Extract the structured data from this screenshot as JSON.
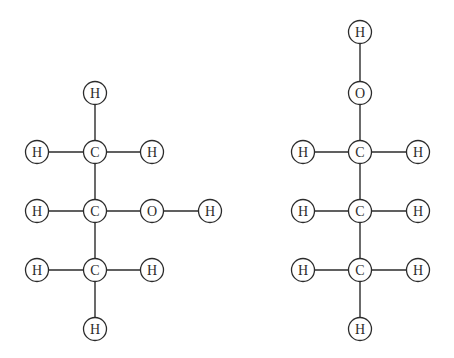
{
  "figure": {
    "background_color": "#ffffff",
    "stroke_color": "#2b2b2b",
    "atom_fill_color": "#ffffff",
    "atom_radius": 11.5,
    "width": 454,
    "height": 358
  },
  "chart_data": {
    "type": "diagram",
    "subtype": "molecular-structure-lewis-diagram",
    "title": "",
    "structures": [
      {
        "id": "molecule-left",
        "name": "propan-2-ol",
        "formula": "C3H8O",
        "atoms": [
          {
            "id": "L-H-top",
            "element": "H",
            "x": 95,
            "y": 93
          },
          {
            "id": "L-C1",
            "element": "C",
            "x": 95,
            "y": 152
          },
          {
            "id": "L-H-c1-left",
            "element": "H",
            "x": 37,
            "y": 152
          },
          {
            "id": "L-H-c1-right",
            "element": "H",
            "x": 152,
            "y": 152
          },
          {
            "id": "L-C2",
            "element": "C",
            "x": 95,
            "y": 211
          },
          {
            "id": "L-H-c2-left",
            "element": "H",
            "x": 37,
            "y": 211
          },
          {
            "id": "L-O",
            "element": "O",
            "x": 152,
            "y": 211
          },
          {
            "id": "L-H-o",
            "element": "H",
            "x": 210,
            "y": 211
          },
          {
            "id": "L-C3",
            "element": "C",
            "x": 95,
            "y": 270
          },
          {
            "id": "L-H-c3-left",
            "element": "H",
            "x": 37,
            "y": 270
          },
          {
            "id": "L-H-c3-right",
            "element": "H",
            "x": 152,
            "y": 270
          },
          {
            "id": "L-H-bottom",
            "element": "H",
            "x": 95,
            "y": 329
          }
        ],
        "bonds": [
          {
            "from": "L-H-top",
            "to": "L-C1",
            "order": 1
          },
          {
            "from": "L-H-c1-left",
            "to": "L-C1",
            "order": 1
          },
          {
            "from": "L-C1",
            "to": "L-H-c1-right",
            "order": 1
          },
          {
            "from": "L-C1",
            "to": "L-C2",
            "order": 1
          },
          {
            "from": "L-H-c2-left",
            "to": "L-C2",
            "order": 1
          },
          {
            "from": "L-C2",
            "to": "L-O",
            "order": 1
          },
          {
            "from": "L-O",
            "to": "L-H-o",
            "order": 1
          },
          {
            "from": "L-C2",
            "to": "L-C3",
            "order": 1
          },
          {
            "from": "L-H-c3-left",
            "to": "L-C3",
            "order": 1
          },
          {
            "from": "L-C3",
            "to": "L-H-c3-right",
            "order": 1
          },
          {
            "from": "L-C3",
            "to": "L-H-bottom",
            "order": 1
          }
        ]
      },
      {
        "id": "molecule-right",
        "name": "propan-1-ol",
        "formula": "C3H8O",
        "atoms": [
          {
            "id": "R-H-top",
            "element": "H",
            "x": 360,
            "y": 32
          },
          {
            "id": "R-O",
            "element": "O",
            "x": 360,
            "y": 93
          },
          {
            "id": "R-C1",
            "element": "C",
            "x": 360,
            "y": 152
          },
          {
            "id": "R-H-c1-left",
            "element": "H",
            "x": 303,
            "y": 152
          },
          {
            "id": "R-H-c1-right",
            "element": "H",
            "x": 418,
            "y": 152
          },
          {
            "id": "R-C2",
            "element": "C",
            "x": 360,
            "y": 211
          },
          {
            "id": "R-H-c2-left",
            "element": "H",
            "x": 303,
            "y": 211
          },
          {
            "id": "R-H-c2-right",
            "element": "H",
            "x": 418,
            "y": 211
          },
          {
            "id": "R-C3",
            "element": "C",
            "x": 360,
            "y": 270
          },
          {
            "id": "R-H-c3-left",
            "element": "H",
            "x": 303,
            "y": 270
          },
          {
            "id": "R-H-c3-right",
            "element": "H",
            "x": 418,
            "y": 270
          },
          {
            "id": "R-H-bottom",
            "element": "H",
            "x": 360,
            "y": 329
          }
        ],
        "bonds": [
          {
            "from": "R-H-top",
            "to": "R-O",
            "order": 1
          },
          {
            "from": "R-O",
            "to": "R-C1",
            "order": 1
          },
          {
            "from": "R-H-c1-left",
            "to": "R-C1",
            "order": 1
          },
          {
            "from": "R-C1",
            "to": "R-H-c1-right",
            "order": 1
          },
          {
            "from": "R-C1",
            "to": "R-C2",
            "order": 1
          },
          {
            "from": "R-H-c2-left",
            "to": "R-C2",
            "order": 1
          },
          {
            "from": "R-C2",
            "to": "R-H-c2-right",
            "order": 1
          },
          {
            "from": "R-C2",
            "to": "R-C3",
            "order": 1
          },
          {
            "from": "R-H-c3-left",
            "to": "R-C3",
            "order": 1
          },
          {
            "from": "R-C3",
            "to": "R-H-c3-right",
            "order": 1
          },
          {
            "from": "R-C3",
            "to": "R-H-bottom",
            "order": 1
          }
        ]
      }
    ]
  }
}
